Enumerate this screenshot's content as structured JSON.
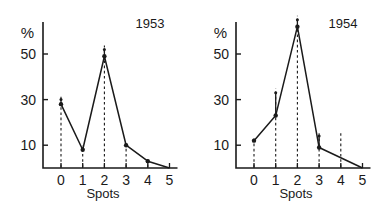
{
  "figure": {
    "background": "#ffffff",
    "ink": "#1a1a1a",
    "width": 386,
    "height": 211
  },
  "chart_data": [
    {
      "type": "line",
      "title": "1953",
      "xlabel": "Spots",
      "ylabel": "%",
      "x": [
        0,
        1,
        2,
        3,
        4,
        5
      ],
      "categories": [
        "0",
        "1",
        "2",
        "3",
        "4",
        "5"
      ],
      "values": [
        28,
        8,
        49,
        10,
        3,
        0
      ],
      "errors_upper": [
        30,
        null,
        52,
        null,
        null,
        null
      ],
      "xticklabels": [
        "0",
        "1",
        "2",
        "3",
        "4",
        "5"
      ],
      "yticks": [
        10,
        30,
        50
      ],
      "yticklabels": [
        "10",
        "30",
        "50"
      ],
      "xlim": [
        -0.55,
        5.2
      ],
      "ylim": [
        0,
        62
      ],
      "grid": false,
      "legend": "none",
      "dropline_style": "dashed",
      "marker": "filled-circle"
    },
    {
      "type": "line",
      "title": "1954",
      "xlabel": "Spots",
      "ylabel": "%",
      "x": [
        0,
        1,
        2,
        3,
        4,
        5
      ],
      "categories": [
        "0",
        "1",
        "2",
        "3",
        "4",
        "5"
      ],
      "values": [
        12,
        23,
        62,
        9,
        null,
        0
      ],
      "errors_upper": [
        null,
        33,
        65,
        14,
        null,
        null
      ],
      "xticklabels": [
        "0",
        "1",
        "2",
        "3",
        "4",
        "5"
      ],
      "yticks": [
        10,
        30,
        50
      ],
      "yticklabels": [
        "10",
        "30",
        "50"
      ],
      "xlim": [
        -0.55,
        5.2
      ],
      "ylim": [
        0,
        68
      ],
      "grid": false,
      "legend": "none",
      "dropline_style": "dashed",
      "marker": "filled-circle"
    }
  ]
}
